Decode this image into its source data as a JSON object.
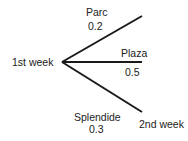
{
  "diagram": {
    "type": "tree",
    "root": {
      "label": "1st week"
    },
    "branches": [
      {
        "name": "Parc",
        "probability": "0.2"
      },
      {
        "name": "Plaza",
        "probability": "0.5"
      },
      {
        "name": "Splendide",
        "probability": "0.3"
      }
    ],
    "stage_label": "2nd week",
    "colors": {
      "line": "#1a1a1a",
      "text": "#222222",
      "background": "#ffffff"
    }
  }
}
